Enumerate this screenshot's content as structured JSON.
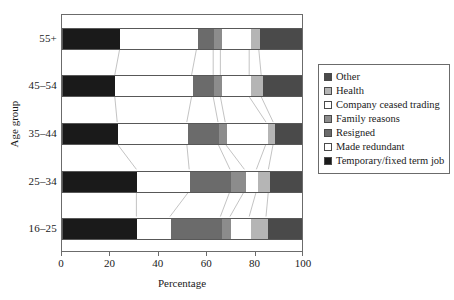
{
  "chart_data": {
    "type": "bar",
    "orientation": "horizontal",
    "stacked": true,
    "stack_mode": "percent",
    "title": "",
    "xlabel": "Percentage",
    "ylabel": "Age group",
    "xlim": [
      0,
      100
    ],
    "xticks": [
      0,
      20,
      40,
      60,
      80,
      100
    ],
    "xticklabels": [
      "0",
      "20",
      "40",
      "60",
      "80",
      "100"
    ],
    "grid": false,
    "legend_position": "right",
    "categories": [
      "16–25",
      "25–34",
      "35–44",
      "45–54",
      "55+"
    ],
    "category_order_top_to_bottom": [
      "55+",
      "45–54",
      "35–44",
      "25–34",
      "16–25"
    ],
    "series": [
      {
        "name": "Temporary/fixed term job",
        "color": "#1a1a1a",
        "values": [
          31,
          31,
          23,
          22,
          24
        ]
      },
      {
        "name": "Made redundant",
        "color": "#ffffff",
        "values": [
          14,
          22,
          29,
          32,
          32
        ]
      },
      {
        "name": "Resigned",
        "color": "#6b6b6b",
        "values": [
          21,
          17,
          13,
          9,
          7
        ]
      },
      {
        "name": "Family reasons",
        "color": "#8c8c8c",
        "values": [
          4,
          6,
          3,
          3,
          3
        ]
      },
      {
        "name": "Company ceased trading",
        "color": "#ffffff",
        "values": [
          8,
          5,
          17,
          12,
          12
        ]
      },
      {
        "name": "Health",
        "color": "#b5b5b5",
        "values": [
          7,
          5,
          3,
          5,
          4
        ]
      },
      {
        "name": "Other",
        "color": "#4a4a4a",
        "values": [
          15,
          14,
          12,
          17,
          18
        ]
      }
    ]
  },
  "axes": {
    "y_title": "Age group",
    "x_title": "Percentage",
    "y_tick_labels": [
      "55+",
      "45–54",
      "35–44",
      "25–34",
      "16–25"
    ],
    "x_tick_labels": [
      "0",
      "20",
      "40",
      "60",
      "80",
      "100"
    ]
  },
  "legend": {
    "items": [
      {
        "label": "Other",
        "color": "#4a4a4a"
      },
      {
        "label": "Health",
        "color": "#b5b5b5"
      },
      {
        "label": "Company ceased trading",
        "color": "#ffffff"
      },
      {
        "label": "Family reasons",
        "color": "#8c8c8c"
      },
      {
        "label": "Resigned",
        "color": "#6b6b6b"
      },
      {
        "label": "Made redundant",
        "color": "#ffffff"
      },
      {
        "label": "Temporary/fixed term job",
        "color": "#1a1a1a"
      }
    ]
  },
  "style": {
    "frame_color": "#6b6b6b",
    "connector_color": "#a8a8a8",
    "background": "#ffffff"
  }
}
